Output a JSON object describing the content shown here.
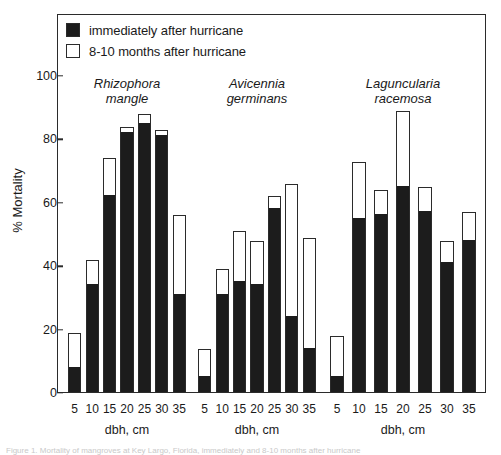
{
  "figure": {
    "caption_fragment": "Figure 1. Mortality of mangroves at Key Largo, Florida, immediately and 8-10 months after hurricane"
  },
  "legend": {
    "items": [
      {
        "label": "immediately after hurricane",
        "swatch": "filled-square-icon",
        "color": "#1c1c1c"
      },
      {
        "label": "8-10 months after hurricane",
        "swatch": "open-square-icon",
        "color": "#ffffff"
      }
    ]
  },
  "axes": {
    "ylabel": "% Mortality",
    "yticks": [
      0,
      20,
      40,
      60,
      80,
      100
    ],
    "ylim": [
      0,
      107
    ],
    "xlabel": "dbh, cm",
    "xticks": [
      "5",
      "10",
      "15",
      "20",
      "25",
      "30",
      "35"
    ]
  },
  "chart_data": {
    "type": "bar",
    "title": "",
    "subtitle": "",
    "xlabel": "dbh, cm",
    "ylabel": "% Mortality",
    "ylim": [
      0,
      107
    ],
    "grid": false,
    "legend_position": "top-left-inside",
    "categories": [
      "5",
      "10",
      "15",
      "20",
      "25",
      "30",
      "35"
    ],
    "groups": [
      {
        "name": "Rhizophora mangle",
        "name_line1": "Rhizophora",
        "name_line2": "mangle",
        "series": [
          {
            "name": "immediately after hurricane",
            "values": [
              8,
              34,
              62,
              82,
              85,
              81,
              31
            ]
          },
          {
            "name": "8-10 months after hurricane",
            "values": [
              19,
              42,
              74,
              84,
              88,
              83,
              56
            ]
          }
        ]
      },
      {
        "name": "Avicennia germinans",
        "name_line1": "Avicennia",
        "name_line2": "germinans",
        "series": [
          {
            "name": "immediately after hurricane",
            "values": [
              5,
              31,
              35,
              34,
              58,
              24,
              14
            ]
          },
          {
            "name": "8-10 months after hurricane",
            "values": [
              14,
              39,
              51,
              48,
              62,
              66,
              49
            ]
          }
        ]
      },
      {
        "name": "Laguncularia racemosa",
        "name_line1": "Laguncularia",
        "name_line2": "racemosa",
        "series": [
          {
            "name": "immediately after hurricane",
            "values": [
              5,
              55,
              56,
              65,
              57,
              41,
              48
            ]
          },
          {
            "name": "8-10 months after hurricane",
            "values": [
              18,
              73,
              64,
              89,
              65,
              48,
              57
            ]
          }
        ]
      }
    ]
  }
}
